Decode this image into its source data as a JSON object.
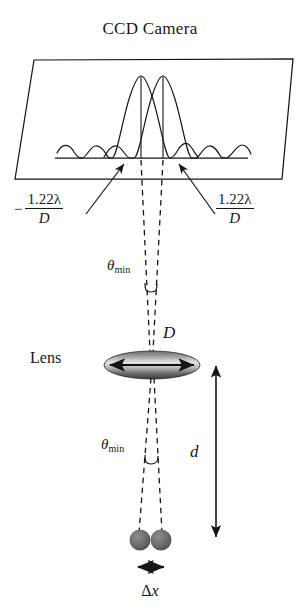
{
  "figure": {
    "title": "CCD Camera",
    "background_color": "#ffffff",
    "line_color": "#161616",
    "lens": {
      "label": "Lens",
      "diameter_label": "D",
      "gradient_dark": "#3a3a3a",
      "gradient_light": "#d8d8d8"
    },
    "distance": {
      "label": "d"
    },
    "separation": {
      "delta": "Δ",
      "variable": "x",
      "label": "Δx"
    },
    "angles": {
      "upper": {
        "symbol": "θ",
        "subscript": "min",
        "label": "θmin"
      },
      "lower": {
        "symbol": "θ",
        "subscript": "min",
        "label": "θmin"
      }
    },
    "formulas": {
      "left": {
        "sign": "−",
        "numerator": "1.22λ",
        "numerator_coefficient": "1.22",
        "numerator_symbol": "λ",
        "denominator": "D",
        "label": "−1.22λ/D"
      },
      "right": {
        "sign": "",
        "numerator": "1.22λ",
        "numerator_coefficient": "1.22",
        "numerator_symbol": "λ",
        "denominator": "D",
        "label": "1.22λ/D"
      }
    },
    "sources": {
      "count": 2,
      "fill_color": "#6e6e6e"
    },
    "airy_patterns": {
      "count": 2,
      "description": "two overlapping Airy diffraction intensity profiles"
    }
  }
}
